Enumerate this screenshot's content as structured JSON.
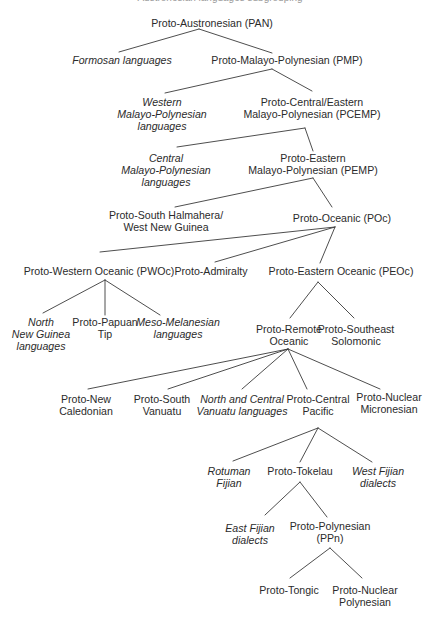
{
  "diagram": {
    "title_cutoff": "Austronesian languages subgrouping",
    "root": "pan",
    "nodes": [
      {
        "id": "pan",
        "lines": [
          "Proto-Austronesian (PAN)"
        ],
        "italic": false,
        "x": 212,
        "y": 17
      },
      {
        "id": "formosan",
        "lines": [
          "Formosan languages"
        ],
        "italic": true,
        "x": 122,
        "y": 54
      },
      {
        "id": "pmp",
        "lines": [
          "Proto-Malayo-Polynesian (PMP)"
        ],
        "italic": false,
        "x": 287,
        "y": 54
      },
      {
        "id": "wmp",
        "lines": [
          "Western",
          "Malayo-Polynesian",
          "languages"
        ],
        "italic": true,
        "x": 162,
        "y": 96
      },
      {
        "id": "pcemp",
        "lines": [
          "Proto-Central/Eastern",
          "Malayo-Polynesian (PCEMP)"
        ],
        "italic": false,
        "x": 312,
        "y": 96
      },
      {
        "id": "cmp",
        "lines": [
          "Central",
          "Malayo-Polynesian",
          "languages"
        ],
        "italic": true,
        "x": 166,
        "y": 152
      },
      {
        "id": "pemp",
        "lines": [
          "Proto-Eastern",
          "Malayo-Polynesian (PEMP)"
        ],
        "italic": false,
        "x": 313,
        "y": 152
      },
      {
        "id": "pshwng",
        "lines": [
          "Proto-South Halmahera/",
          "West New Guinea"
        ],
        "italic": false,
        "x": 166,
        "y": 209
      },
      {
        "id": "poc",
        "lines": [
          "Proto-Oceanic (POc)"
        ],
        "italic": false,
        "x": 342,
        "y": 212
      },
      {
        "id": "pwoc",
        "lines": [
          "Proto-Western Oceanic (PWOc)"
        ],
        "italic": false,
        "x": 99,
        "y": 265
      },
      {
        "id": "padm",
        "lines": [
          "Proto-Admiralty"
        ],
        "italic": false,
        "x": 211,
        "y": 265
      },
      {
        "id": "peoc",
        "lines": [
          "Proto-Eastern Oceanic (PEOc)"
        ],
        "italic": false,
        "x": 341,
        "y": 265
      },
      {
        "id": "nng",
        "lines": [
          "North",
          "New Guinea",
          "languages"
        ],
        "italic": true,
        "x": 41,
        "y": 316
      },
      {
        "id": "ppt",
        "lines": [
          "Proto-Papuan",
          "Tip"
        ],
        "italic": false,
        "x": 105,
        "y": 316
      },
      {
        "id": "mmel",
        "lines": [
          "Meso-Melanesian",
          "languages"
        ],
        "italic": true,
        "x": 178,
        "y": 316
      },
      {
        "id": "pro",
        "lines": [
          "Proto-Remote",
          "Oceanic"
        ],
        "italic": false,
        "x": 289,
        "y": 323
      },
      {
        "id": "pses",
        "lines": [
          "Proto-Southeast",
          "Solomonic"
        ],
        "italic": false,
        "x": 356,
        "y": 323
      },
      {
        "id": "pnc",
        "lines": [
          "Proto-New",
          "Caledonian"
        ],
        "italic": false,
        "x": 86,
        "y": 393
      },
      {
        "id": "psv",
        "lines": [
          "Proto-South",
          "Vanuatu"
        ],
        "italic": false,
        "x": 162,
        "y": 393
      },
      {
        "id": "ncv",
        "lines": [
          "North and Central",
          "Vanuatu languages"
        ],
        "italic": true,
        "x": 242,
        "y": 393
      },
      {
        "id": "pcp",
        "lines": [
          "Proto-Central",
          "Pacific"
        ],
        "italic": false,
        "x": 318,
        "y": 393
      },
      {
        "id": "pnm",
        "lines": [
          "Proto-Nuclear",
          "Micronesian"
        ],
        "italic": false,
        "x": 389,
        "y": 391
      },
      {
        "id": "rot",
        "lines": [
          "Rotuman",
          "Fijian"
        ],
        "italic": true,
        "x": 229,
        "y": 465
      },
      {
        "id": "ptok",
        "lines": [
          "Proto-Tokelau"
        ],
        "italic": false,
        "x": 300,
        "y": 465
      },
      {
        "id": "wfd",
        "lines": [
          "West Fijian",
          "dialects"
        ],
        "italic": true,
        "x": 378,
        "y": 465
      },
      {
        "id": "efd",
        "lines": [
          "East Fijian",
          "dialects"
        ],
        "italic": true,
        "x": 250,
        "y": 522
      },
      {
        "id": "ppn",
        "lines": [
          "Proto-Polynesian",
          "(PPn)"
        ],
        "italic": false,
        "x": 330,
        "y": 520
      },
      {
        "id": "ptong",
        "lines": [
          "Proto-Tongic"
        ],
        "italic": false,
        "x": 289,
        "y": 584
      },
      {
        "id": "pnp",
        "lines": [
          "Proto-Nuclear",
          "Polynesian"
        ],
        "italic": false,
        "x": 365,
        "y": 584
      }
    ],
    "edges": [
      {
        "from": "pan",
        "to": "formosan",
        "x1": 199,
        "y1": 29,
        "x2": 119,
        "y2": 52
      },
      {
        "from": "pan",
        "to": "pmp",
        "x1": 199,
        "y1": 29,
        "x2": 272,
        "y2": 53
      },
      {
        "from": "pmp",
        "to": "wmp",
        "x1": 272,
        "y1": 69,
        "x2": 165,
        "y2": 93
      },
      {
        "from": "pmp",
        "to": "pcemp",
        "x1": 272,
        "y1": 69,
        "x2": 312,
        "y2": 91
      },
      {
        "from": "pcemp",
        "to": "cmp",
        "x1": 305,
        "y1": 128,
        "x2": 177,
        "y2": 147
      },
      {
        "from": "pcemp",
        "to": "pemp",
        "x1": 305,
        "y1": 128,
        "x2": 313,
        "y2": 151
      },
      {
        "from": "pemp",
        "to": "pshwng",
        "x1": 313,
        "y1": 178,
        "x2": 175,
        "y2": 207
      },
      {
        "from": "pemp",
        "to": "poc",
        "x1": 313,
        "y1": 178,
        "x2": 332,
        "y2": 207
      },
      {
        "from": "poc",
        "to": "pwoc",
        "x1": 335,
        "y1": 227,
        "x2": 100,
        "y2": 252
      },
      {
        "from": "poc",
        "to": "padm",
        "x1": 335,
        "y1": 227,
        "x2": 215,
        "y2": 262
      },
      {
        "from": "poc",
        "to": "peoc",
        "x1": 335,
        "y1": 227,
        "x2": 320,
        "y2": 263
      },
      {
        "from": "pwoc",
        "to": "nng",
        "x1": 105,
        "y1": 280,
        "x2": 43,
        "y2": 313
      },
      {
        "from": "pwoc",
        "to": "ppt",
        "x1": 105,
        "y1": 280,
        "x2": 105,
        "y2": 315
      },
      {
        "from": "pwoc",
        "to": "mmel",
        "x1": 105,
        "y1": 280,
        "x2": 160,
        "y2": 315
      },
      {
        "from": "peoc",
        "to": "pro",
        "x1": 318,
        "y1": 282,
        "x2": 290,
        "y2": 318
      },
      {
        "from": "peoc",
        "to": "pses",
        "x1": 318,
        "y1": 282,
        "x2": 354,
        "y2": 318
      },
      {
        "from": "pro",
        "to": "pnc",
        "x1": 288,
        "y1": 349,
        "x2": 88,
        "y2": 389
      },
      {
        "from": "pro",
        "to": "psv",
        "x1": 288,
        "y1": 349,
        "x2": 168,
        "y2": 389
      },
      {
        "from": "pro",
        "to": "ncv",
        "x1": 288,
        "y1": 349,
        "x2": 242,
        "y2": 389
      },
      {
        "from": "pro",
        "to": "pcp",
        "x1": 288,
        "y1": 349,
        "x2": 307,
        "y2": 389
      },
      {
        "from": "pro",
        "to": "pnm",
        "x1": 288,
        "y1": 349,
        "x2": 380,
        "y2": 389
      },
      {
        "from": "pcp",
        "to": "rot",
        "x1": 318,
        "y1": 428,
        "x2": 233,
        "y2": 461
      },
      {
        "from": "pcp",
        "to": "ptok",
        "x1": 318,
        "y1": 428,
        "x2": 300,
        "y2": 462
      },
      {
        "from": "pcp",
        "to": "wfd",
        "x1": 318,
        "y1": 428,
        "x2": 372,
        "y2": 462
      },
      {
        "from": "ptok",
        "to": "efd",
        "x1": 300,
        "y1": 482,
        "x2": 265,
        "y2": 515
      },
      {
        "from": "ptok",
        "to": "ppn",
        "x1": 300,
        "y1": 482,
        "x2": 327,
        "y2": 517
      },
      {
        "from": "ppn",
        "to": "ptong",
        "x1": 330,
        "y1": 548,
        "x2": 290,
        "y2": 578
      },
      {
        "from": "ppn",
        "to": "pnp",
        "x1": 330,
        "y1": 548,
        "x2": 362,
        "y2": 578
      }
    ]
  },
  "style": {
    "line_color": "#3a3a3a",
    "text_color": "#2b2b2b",
    "background": "#ffffff"
  }
}
